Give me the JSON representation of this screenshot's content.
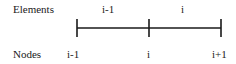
{
  "diagram": {
    "row_labels": {
      "elements": "Elements",
      "nodes": "Nodes"
    },
    "elements": [
      {
        "label": "i-1"
      },
      {
        "label": "i"
      }
    ],
    "nodes": [
      {
        "label": "i-1"
      },
      {
        "label": "i"
      },
      {
        "label": "i+1"
      }
    ],
    "colors": {
      "line": "#1a1a1a",
      "text": "#1a1a1a",
      "background": "#ffffff"
    }
  }
}
